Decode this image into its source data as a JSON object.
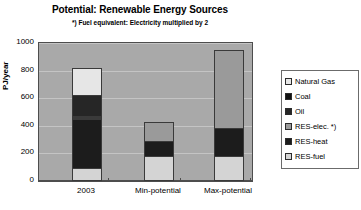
{
  "chart_data": {
    "type": "bar",
    "title": "Potential: Renewable Energy Sources",
    "subtitle": "*) Fuel equivalent: Electricity multiplied by 2",
    "xlabel": "",
    "ylabel": "PJ/year",
    "ylim": [
      0,
      1000
    ],
    "ytick_labels": [
      "1000",
      "800",
      "600",
      "400",
      "200",
      "0"
    ],
    "ytick_values": [
      1000,
      800,
      600,
      400,
      200,
      0
    ],
    "grid": true,
    "stacked": true,
    "legend_position": "right",
    "categories": [
      "2003",
      "Min-potential",
      "Max-potential"
    ],
    "series": [
      {
        "name": "RES-fuel",
        "color": "#d4d4d4",
        "values": [
          90,
          180,
          180
        ]
      },
      {
        "name": "RES-heat",
        "color": "#1c1c1c",
        "values": [
          360,
          110,
          200
        ]
      },
      {
        "name": "RES-elec. *)",
        "color": "#9a9a9a",
        "values": [
          25,
          140,
          570
        ]
      },
      {
        "name": "Oil",
        "color": "#262626",
        "values": [
          155,
          0,
          0
        ]
      },
      {
        "name": "Coal",
        "color": "#111111",
        "values": [
          0,
          0,
          0
        ]
      },
      {
        "name": "Natural Gas",
        "color": "#e6e6e6",
        "values": [
          190,
          0,
          0
        ]
      }
    ],
    "totals": [
      820,
      430,
      950
    ],
    "legend": [
      {
        "label": "Natural Gas",
        "color": "#e6e6e6"
      },
      {
        "label": "Coal",
        "color": "#111111"
      },
      {
        "label": "Oil",
        "color": "#262626"
      },
      {
        "label": "RES-elec. *)",
        "color": "#9a9a9a"
      },
      {
        "label": "RES-heat",
        "color": "#1c1c1c"
      },
      {
        "label": "RES-fuel",
        "color": "#d4d4d4"
      }
    ],
    "bars": [
      {
        "category": "2003",
        "total": 820,
        "stack": [
          {
            "series": "RES-fuel",
            "value": 90,
            "color": "#d4d4d4"
          },
          {
            "series": "RES-heat",
            "value": 360,
            "color": "#1c1c1c"
          },
          {
            "series": "RES-elec. *)",
            "value": 25,
            "color": "#3a3a3a"
          },
          {
            "series": "Oil",
            "value": 155,
            "color": "#262626"
          },
          {
            "series": "Natural Gas",
            "value": 190,
            "color": "#e6e6e6"
          }
        ]
      },
      {
        "category": "Min-potential",
        "total": 430,
        "stack": [
          {
            "series": "RES-fuel",
            "value": 180,
            "color": "#d4d4d4"
          },
          {
            "series": "RES-heat",
            "value": 110,
            "color": "#1c1c1c"
          },
          {
            "series": "RES-elec. *)",
            "value": 140,
            "color": "#9a9a9a"
          }
        ]
      },
      {
        "category": "Max-potential",
        "total": 950,
        "stack": [
          {
            "series": "RES-fuel",
            "value": 180,
            "color": "#d4d4d4"
          },
          {
            "series": "RES-heat",
            "value": 200,
            "color": "#1c1c1c"
          },
          {
            "series": "RES-elec. *)",
            "value": 570,
            "color": "#9a9a9a"
          }
        ]
      }
    ],
    "plot_background": "#a9a9a9",
    "gridline_color": "#c4c4c4",
    "frame_color": "#4d4d4d"
  }
}
